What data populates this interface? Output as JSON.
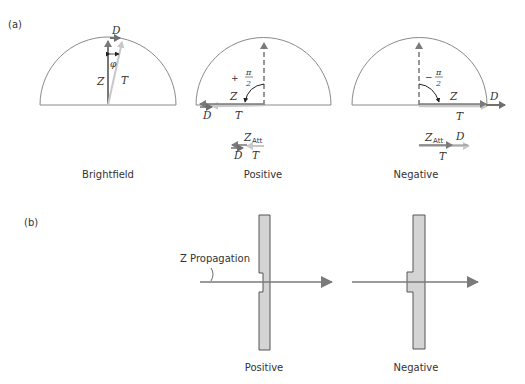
{
  "panel_a": {
    "label": "(a)",
    "diagrams": [
      {
        "caption": "Brightfield",
        "vectors": {
          "z": "Z",
          "d": "D",
          "t": "T"
        },
        "angle_label": "φ"
      },
      {
        "caption": "Positive",
        "vectors": {
          "z": "Z",
          "d": "D",
          "t": "T"
        },
        "angle_sign": "+",
        "angle_num": "π",
        "angle_den": "2",
        "attenuated": {
          "z": "Z",
          "z_sub": "Att",
          "d": "D",
          "t": "T"
        }
      },
      {
        "caption": "Negative",
        "vectors": {
          "z": "Z",
          "d": "D",
          "t": "T"
        },
        "angle_sign": "−",
        "angle_num": "π",
        "angle_den": "2",
        "attenuated": {
          "z": "Z",
          "z_sub": "Att",
          "d": "D",
          "t": "T"
        }
      }
    ]
  },
  "panel_b": {
    "label": "(b)",
    "propagation_label": "Z Propagation",
    "plates": [
      {
        "caption": "Positive"
      },
      {
        "caption": "Negative"
      }
    ]
  },
  "colors": {
    "line": "#8a8a8a",
    "z_vector": "#777777",
    "d_vector": "#6f6f6f",
    "t_vector": "#c8c8c8",
    "plate_fill": "#d4d4d4",
    "text": "#333333"
  }
}
